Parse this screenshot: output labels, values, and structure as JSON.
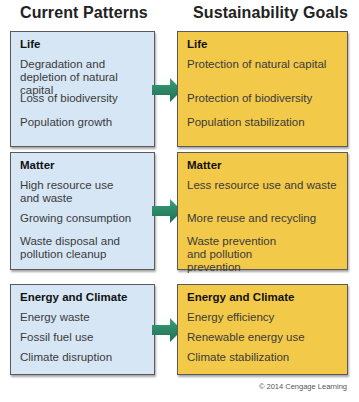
{
  "headers": {
    "left": "Current Patterns",
    "right": "Sustainability Goals"
  },
  "rows": [
    {
      "category": "Life",
      "current": [
        "Degradation and depletion of natural capital",
        "Loss of biodiversity",
        "Population growth"
      ],
      "goals": [
        "Protection of natural capital",
        "Protection of biodiversity",
        "Population stabilization"
      ]
    },
    {
      "category": "Matter",
      "current": [
        "High resource use and waste",
        "Growing consumption",
        "Waste disposal and pollution cleanup"
      ],
      "goals": [
        "Less resource use and waste",
        "More reuse and recycling",
        "Waste prevention and pollution prevention"
      ]
    },
    {
      "category": "Energy and Climate",
      "current": [
        "Energy waste",
        "Fossil fuel use",
        "Climate disruption"
      ],
      "goals": [
        "Energy efficiency",
        "Renewable energy use",
        "Climate stabilization"
      ]
    }
  ],
  "colors": {
    "current_box": "#d6e6f5",
    "goal_box": "#f3c94a",
    "arrow": "#2a8a6a"
  },
  "copyright": "© 2014 Cengage Learning"
}
